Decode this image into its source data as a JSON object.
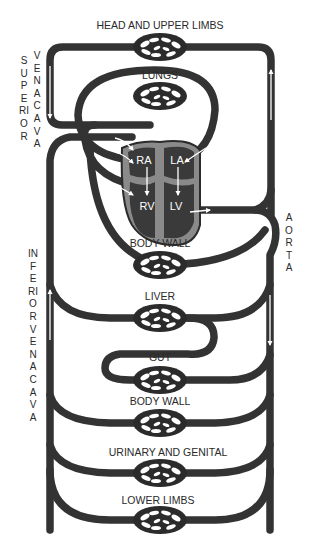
{
  "colors": {
    "vessel": "#333333",
    "heart_outer": "#8a8a8a",
    "heart_chamber": "#3a3a3a",
    "arrow": "#ffffff",
    "text": "#2a2a2a",
    "background": "#ffffff"
  },
  "capillary_beds": [
    {
      "id": "head",
      "label": "HEAD AND UPPER LIMBS"
    },
    {
      "id": "lungs",
      "label": "LUNGS"
    },
    {
      "id": "body_wall_upper",
      "label": "BODY WALL"
    },
    {
      "id": "liver",
      "label": "LIVER"
    },
    {
      "id": "gut",
      "label": "GUT"
    },
    {
      "id": "body_wall_lower",
      "label": "BODY WALL"
    },
    {
      "id": "urinary",
      "label": "URINARY AND GENITAL"
    },
    {
      "id": "lower_limbs",
      "label": "LOWER LIMBS"
    }
  ],
  "heart": {
    "chambers": [
      {
        "id": "ra",
        "label": "RA"
      },
      {
        "id": "la",
        "label": "LA"
      },
      {
        "id": "rv",
        "label": "RV"
      },
      {
        "id": "lv",
        "label": "LV"
      }
    ]
  },
  "vessel_labels": {
    "superior_vena_cava_1": "SUPERIOR",
    "superior_vena_cava_2": "VENA CAVA",
    "inferior_vena_cava": "INFERIOR VENA CAVA",
    "aorta": "AORTA"
  }
}
